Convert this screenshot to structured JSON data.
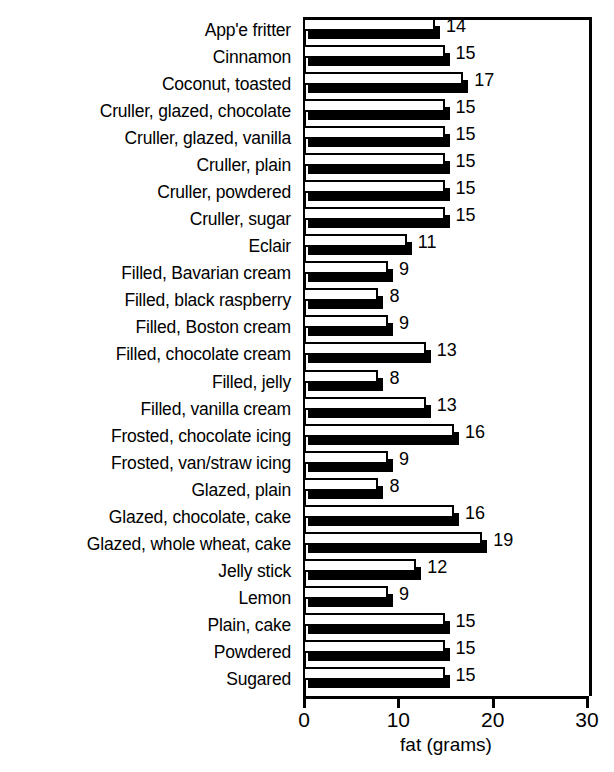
{
  "chart_data": {
    "type": "bar",
    "orientation": "horizontal",
    "title": "",
    "xlabel": "fat (grams)",
    "ylabel": "",
    "xlim": [
      0,
      30
    ],
    "xticks": [
      0,
      10,
      20,
      30
    ],
    "xtick_labels": [
      "0",
      "10",
      "20",
      "30"
    ],
    "grid": false,
    "legend": null,
    "value_labels_shown": true,
    "categories": [
      "App'e fritter",
      "Cinnamon",
      "Coconut, toasted",
      "Cruller, glazed, chocolate",
      "Cruller, glazed, vanilla",
      "Cruller, plain",
      "Cruller, powdered",
      "Cruller, sugar",
      "Eclair",
      "Filled, Bavarian cream",
      "Filled, black raspberry",
      "Filled, Boston cream",
      "Filled, chocolate cream",
      "Filled, jelly",
      "Filled, vanilla cream",
      "Frosted, chocolate icing",
      "Frosted, van/straw icing",
      "Glazed, plain",
      "Glazed, chocolate, cake",
      "Glazed, whole wheat, cake",
      "Jelly stick",
      "Lemon",
      "Plain, cake",
      "Powdered",
      "Sugared"
    ],
    "values": [
      14,
      15,
      17,
      15,
      15,
      15,
      15,
      15,
      11,
      9,
      8,
      9,
      13,
      8,
      13,
      16,
      9,
      8,
      16,
      19,
      12,
      9,
      15,
      15,
      15
    ],
    "value_label_texts": [
      "14",
      "15",
      "17",
      "15",
      "15",
      "15",
      "15",
      "15",
      "11",
      "9",
      "8",
      "9",
      "13",
      "8",
      "13",
      "16",
      "9",
      "8",
      "16",
      "19",
      "12",
      "9",
      "15",
      "15",
      "15"
    ]
  },
  "colors": {
    "bar_face": "#ffffff",
    "bar_shadow": "#000000",
    "axis": "#000000",
    "text": "#000000",
    "background": "#ffffff"
  }
}
